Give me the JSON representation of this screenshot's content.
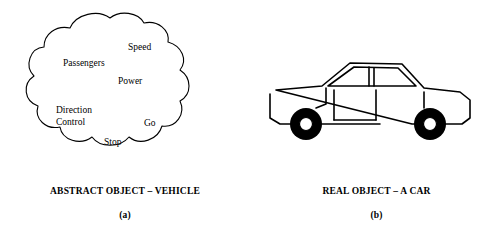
{
  "figure": {
    "panel_a": {
      "diagram_type": "cloud-shape",
      "labels": [
        {
          "id": "speed",
          "text": "Speed"
        },
        {
          "id": "passengers",
          "text": "Passengers"
        },
        {
          "id": "power",
          "text": "Power"
        },
        {
          "id": "direction",
          "text": "Direction"
        },
        {
          "id": "control",
          "text": "Control"
        },
        {
          "id": "go",
          "text": "Go"
        },
        {
          "id": "stop",
          "text": "Stop"
        }
      ],
      "caption": "ABSTRACT OBJECT – VEHICLE",
      "sub_caption": "(a)"
    },
    "panel_b": {
      "diagram_type": "car-outline",
      "caption": "REAL OBJECT – A CAR",
      "sub_caption": "(b)"
    },
    "colors": {
      "background": "#ffffff",
      "stroke": "#000000",
      "text": "#000000"
    }
  }
}
